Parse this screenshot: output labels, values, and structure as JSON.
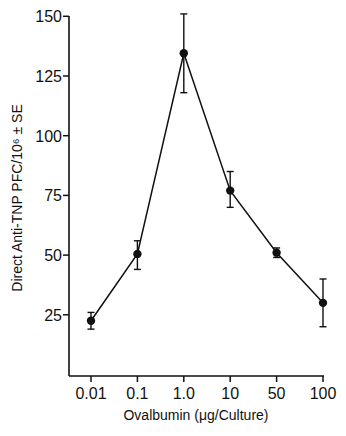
{
  "chart_data": {
    "type": "line",
    "title": "",
    "xlabel": "Ovalbumin (μg/Culture)",
    "ylabel": "Direct Anti-TNP PFC/10⁶ ± SE",
    "categories": [
      "0.01",
      "0.1",
      "1.0",
      "10",
      "50",
      "100"
    ],
    "series": [
      {
        "name": "Anti-TNP PFC",
        "values": [
          22.5,
          50.5,
          134.5,
          77,
          51,
          30
        ],
        "error_upper": [
          26,
          56,
          151,
          85,
          53,
          40
        ],
        "error_lower": [
          19,
          44,
          118,
          70,
          49,
          20
        ]
      }
    ],
    "yticks": [
      25,
      50,
      75,
      100,
      125,
      150
    ],
    "ylim": [
      0,
      150
    ],
    "grid": false,
    "legend": null
  }
}
